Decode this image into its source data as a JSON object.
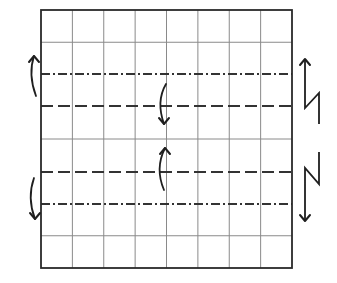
{
  "diagram": {
    "type": "origami-fold-diagram",
    "canvas": {
      "width": 337,
      "height": 283
    },
    "colors": {
      "background": "#ffffff",
      "border": "#2a2a2a",
      "grid": "#8a8a8a",
      "fold_line": "#333333",
      "arrow": "#1f1f1f"
    },
    "grid": {
      "x": 41,
      "y": 10,
      "width": 251,
      "height": 258,
      "columns": 8,
      "rows": 8
    },
    "fold_lines": [
      {
        "name": "mountain-fold-upper",
        "kind": "mountain",
        "style": "dash-dot",
        "y": 74
      },
      {
        "name": "valley-fold-upper",
        "kind": "valley",
        "style": "dashed",
        "y": 106
      },
      {
        "name": "valley-fold-lower",
        "kind": "valley",
        "style": "dashed",
        "y": 172
      },
      {
        "name": "mountain-fold-lower",
        "kind": "mountain",
        "style": "dash-dot",
        "y": 204
      }
    ],
    "arrows": [
      {
        "name": "fold-arrow-left-upper",
        "icon": "curved-arrow-up-icon",
        "path": "M36 96 C 30 80, 30 68, 34 56",
        "head": [
          34,
          56
        ],
        "direction": "up"
      },
      {
        "name": "fold-arrow-center-upper",
        "icon": "curved-arrow-down-icon",
        "path": "M166 84 C 159 96, 159 110, 164 124",
        "head": [
          164,
          124
        ],
        "direction": "down"
      },
      {
        "name": "fold-arrow-center-lower",
        "icon": "curved-arrow-up-icon",
        "path": "M164 190 C 158 176, 158 162, 165 148",
        "head": [
          165,
          148
        ],
        "direction": "up"
      },
      {
        "name": "fold-arrow-left-lower",
        "icon": "curved-arrow-down-icon",
        "path": "M34 178 C 29 192, 30 206, 35 219",
        "head": [
          35,
          219
        ],
        "direction": "down"
      }
    ],
    "pleat_arrows": [
      {
        "name": "pleat-arrow-upper-right",
        "icon": "pleat-arrow-up-icon",
        "path": "M319 124 L319 93 L305 108 L305 59",
        "head": [
          305,
          59
        ],
        "direction": "up"
      },
      {
        "name": "pleat-arrow-lower-right",
        "icon": "pleat-arrow-down-icon",
        "path": "M319 152 L319 184 L305 168 L305 221",
        "head": [
          305,
          221
        ],
        "direction": "down"
      }
    ]
  }
}
